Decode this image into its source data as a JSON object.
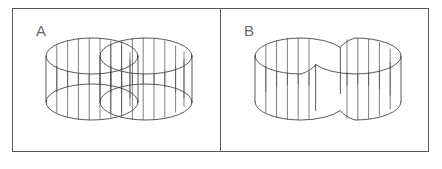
{
  "figure": {
    "background_color": "#ffffff",
    "line_color": "#3a3a3a",
    "frame_color": "#5a5a5a",
    "label_color": "#6b6b6b",
    "width": 442,
    "height": 169
  },
  "panels": [
    {
      "id": "panel-a",
      "label": "A",
      "label_x": 36,
      "label_y": 33,
      "description": "Two separate transparent wireframe cylinders that intersect and overlap; both full top and bottom ellipses remain visible through each other",
      "frame": {
        "x": 12,
        "y": 8,
        "width": 208,
        "height": 144
      },
      "cylinders": [
        {
          "cx": 92,
          "top_cy": 56,
          "bottom_cy": 102,
          "rx": 46,
          "ry": 18,
          "rulings": 9
        },
        {
          "cx": 146,
          "top_cy": 56,
          "bottom_cy": 102,
          "rx": 46,
          "ry": 18,
          "rulings": 9
        }
      ]
    },
    {
      "id": "panel-b",
      "label": "B",
      "label_x": 244,
      "label_y": 33,
      "description": "Single merged peanut / figure-eight shaped solid with a pinched waist where the two lobes join; hidden rear edges omitted",
      "frame": {
        "x": 221,
        "y": 8,
        "width": 208,
        "height": 144
      },
      "cylinders": [
        {
          "cx": 301,
          "top_cy": 56,
          "bottom_cy": 102,
          "rx": 46,
          "ry": 18,
          "rulings": 9
        },
        {
          "cx": 355,
          "top_cy": 56,
          "bottom_cy": 102,
          "rx": 46,
          "ry": 18,
          "rulings": 9
        }
      ]
    }
  ]
}
